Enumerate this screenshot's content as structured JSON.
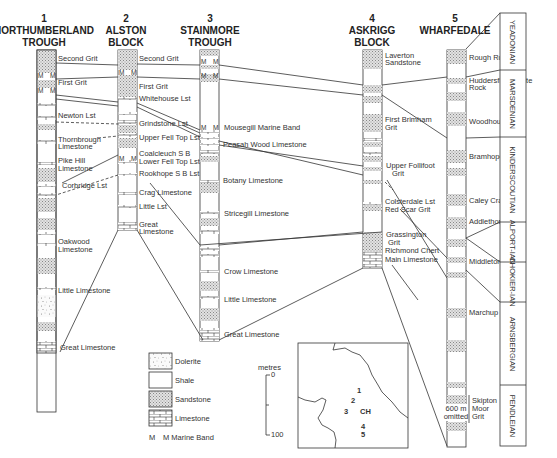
{
  "columns": [
    {
      "num": "1",
      "name_lines": [
        "NORTHUMBERLAND",
        "TROUGH"
      ],
      "labels": [
        "Second Grit",
        "First Grit",
        "Newton Lst",
        "Thornbrough",
        "Limestone",
        "Pike Hill",
        "Limestone",
        "Corbridge Lst",
        "Oakwood",
        "Limestone",
        "Little Limestone",
        "Great Limestone"
      ]
    },
    {
      "num": "2",
      "name_lines": [
        "ALSTON",
        "BLOCK"
      ],
      "labels": [
        "Second Grit",
        "First Grit",
        "Whitehouse Lst",
        "Grindstone Lst",
        "Upper Fell Top Lst",
        "Coalcleuch S B",
        "Lower Fell Top Lst",
        "Rookhope S B Lst",
        "Crag Limestone",
        "Little Lst",
        "Great",
        "Limestone"
      ]
    },
    {
      "num": "3",
      "name_lines": [
        "STAINMORE",
        "TROUGH"
      ],
      "labels": [
        "Mousegill Marine Band",
        "Peasah Wood Limestone",
        "Botany Limestone",
        "Stricegill Limestone",
        "Crow Limestone",
        "Little Limestone",
        "Great Limestone"
      ]
    },
    {
      "num": "4",
      "name_lines": [
        "ASKRIGG",
        "BLOCK"
      ],
      "labels": [
        "Laverton",
        "Sandstone",
        "First Brimham",
        "Grit",
        "Upper Follifoot",
        "Grit",
        "Colsterdale Lst",
        "Red Scar Grit",
        "Grassington",
        "Grit",
        "Richmond Chert",
        "Main Limestone"
      ]
    },
    {
      "num": "5",
      "name_lines": [
        "WHARFEDALE"
      ],
      "labels": [
        "Rough Rock",
        "Huddersfield White",
        "Rock",
        "Woodhouse Grit",
        "Bramhope Grit",
        "Caley Crags Grit",
        "Addlethorpe Grit",
        "Middleton Grit",
        "Marchup Grit",
        "Skipton",
        "Moor",
        "Grit"
      ],
      "omitted_note": [
        "600 m",
        "omitted"
      ]
    }
  ],
  "marine_band_marker": "M",
  "stages": [
    "YEADONIAN",
    "MARSDENIAN",
    "KINDERSCOUTIAN",
    "ALPORT-IAN",
    "CHOKIER-IAN",
    "ARNSBERGIAN",
    "PENDLEIAN"
  ],
  "legend": {
    "items": [
      "Dolerite",
      "Shale",
      "Sandstone",
      "Limestone"
    ],
    "marine_band": "M Marine Band",
    "marine_band_m": "M"
  },
  "scale": {
    "unit": "metres",
    "top": "0",
    "bottom": "100"
  },
  "inset_map": {
    "labels": [
      "1",
      "2",
      "3",
      "CH",
      "4",
      "5"
    ]
  }
}
